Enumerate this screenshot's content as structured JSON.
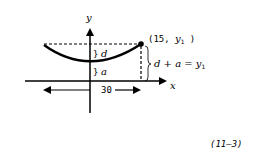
{
  "diagram": {
    "axes": {
      "x_label": "x",
      "y_label": "y"
    },
    "point_label": {
      "prefix": "(15, ",
      "var": "y",
      "sub": "1",
      "suffix": " )"
    },
    "segment_d_label": "d",
    "segment_a_label": "a",
    "equation": {
      "lhs": "d + a = ",
      "var": "y",
      "sub": "1"
    },
    "span_label": "30",
    "figure_ref": "(11–3)"
  },
  "colors": {
    "stroke": "#000000",
    "background": "#ffffff"
  }
}
